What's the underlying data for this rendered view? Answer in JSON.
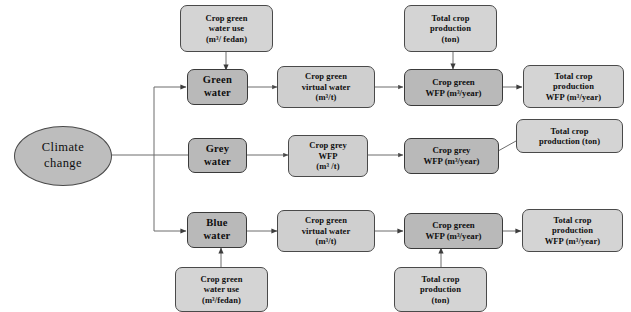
{
  "diagram": {
    "type": "flowchart",
    "background_color": "#ffffff",
    "node_fill_color": "#cfcfcf",
    "node_fill_color_emphasis": "#b9b9b9",
    "node_border_color": "#4a4a4a",
    "edge_color": "#555555"
  },
  "nodes": {
    "climate_change": "Climate\nchange",
    "green_water": "Green\nwater",
    "grey_water": "Grey\nwater",
    "blue_water": "Blue\nwater",
    "crop_green_water_use_top": "Crop  green\nwater use\n(m³/ fedan)",
    "crop_green_water_use_bottom": "Crop  green\nwater use\n(m³/fedan)",
    "total_crop_production_top": "Total crop\nproduction\n(ton)",
    "total_crop_production_mid": "Total crop\nproduction (ton)",
    "total_crop_production_bottom": "Total crop\nproduction\n(ton)",
    "crop_green_virtual_water_row1": "Crop green\nvirtual water\n(m³/t)",
    "crop_green_virtual_water_row3": "Crop green\nvirtual water\n(m³/t)",
    "crop_green_wfp_row1": "Crop green\nWFP (m³/year)",
    "crop_green_wfp_row3": "Crop green\nWFP (m³/year)",
    "crop_grey_wfp_t": "Crop grey\nWFP\n(m³ /t)",
    "crop_grey_wfp_year": "Crop grey\nWFP (m³/year)",
    "total_crop_production_wfp_row1": "Total crop\nproduction\nWFP (m³/year)",
    "total_crop_production_wfp_row3": "Total crop\nproduction\nWFP (m³/year)"
  },
  "edges": [
    {
      "from": "climate_change",
      "to": "green_water",
      "style": "orthogonal-arrow"
    },
    {
      "from": "climate_change",
      "to": "grey_water",
      "style": "orthogonal-line"
    },
    {
      "from": "climate_change",
      "to": "blue_water",
      "style": "orthogonal-arrow"
    },
    {
      "from": "crop_green_water_use_top",
      "to": "green_water",
      "style": "arrow-down"
    },
    {
      "from": "green_water",
      "to": "crop_green_virtual_water_row1",
      "style": "arrow-right"
    },
    {
      "from": "crop_green_virtual_water_row1",
      "to": "crop_green_wfp_row1",
      "style": "arrow-right"
    },
    {
      "from": "total_crop_production_top",
      "to": "crop_green_wfp_row1",
      "style": "arrow-down"
    },
    {
      "from": "crop_green_wfp_row1",
      "to": "total_crop_production_wfp_row1",
      "style": "arrow-right"
    },
    {
      "from": "grey_water",
      "to": "crop_grey_wfp_t",
      "style": "arrow-right"
    },
    {
      "from": "crop_grey_wfp_t",
      "to": "crop_grey_wfp_year",
      "style": "arrow-right"
    },
    {
      "from": "total_crop_production_mid",
      "to": "crop_grey_wfp_year",
      "style": "arrow-diagonal"
    },
    {
      "from": "crop_green_water_use_bottom",
      "to": "blue_water",
      "style": "arrow-up"
    },
    {
      "from": "blue_water",
      "to": "crop_green_virtual_water_row3",
      "style": "arrow-right"
    },
    {
      "from": "crop_green_virtual_water_row3",
      "to": "crop_green_wfp_row3",
      "style": "arrow-right"
    },
    {
      "from": "total_crop_production_bottom",
      "to": "crop_green_wfp_row3",
      "style": "arrow-up"
    },
    {
      "from": "crop_green_wfp_row3",
      "to": "total_crop_production_wfp_row3",
      "style": "arrow-right"
    }
  ]
}
